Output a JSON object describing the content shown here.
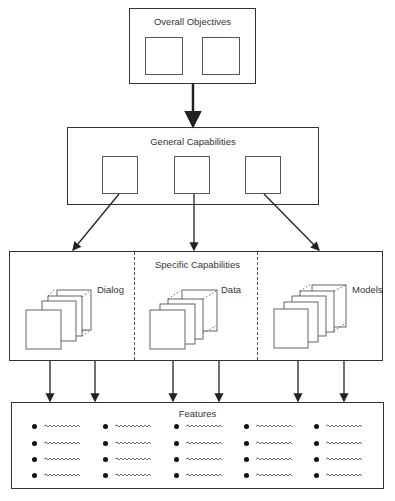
{
  "diagram": {
    "overall": {
      "title": "Overall Objectives",
      "sub_boxes": 2
    },
    "general": {
      "title": "General Capabilities",
      "sub_boxes": 3
    },
    "specific": {
      "title": "Specific Capabilities",
      "sections": [
        {
          "label": "Dialog"
        },
        {
          "label": "Data"
        },
        {
          "label": "Models"
        }
      ]
    },
    "features": {
      "title": "Features",
      "columns": 5,
      "rows": 4
    },
    "colors": {
      "line": "#333333",
      "background": "#ffffff"
    }
  }
}
